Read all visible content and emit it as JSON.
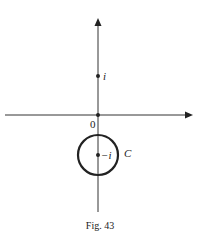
{
  "figure": {
    "caption": "Fig. 43",
    "origin_label": "0",
    "points": [
      {
        "label": "i",
        "x": 98,
        "y": 76
      },
      {
        "label": "−i",
        "x": 98,
        "y": 155
      }
    ],
    "curve": {
      "label": "C",
      "cx": 98,
      "cy": 155,
      "r": 20
    },
    "colors": {
      "ink": "#222222",
      "background": "#ffffff"
    }
  }
}
